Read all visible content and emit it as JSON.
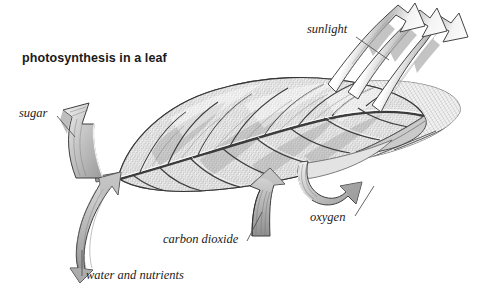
{
  "figure": {
    "title": "photosynthesis in a leaf",
    "background_color": "#ffffff",
    "ink_color": "#1b1b1b",
    "labels": [
      {
        "id": "sunlight",
        "text": "sunlight",
        "style": "italic",
        "x": 307,
        "y": 33,
        "anchor": "start"
      },
      {
        "id": "sugar",
        "text": "sugar",
        "style": "italic",
        "x": 19,
        "y": 117,
        "anchor": "start"
      },
      {
        "id": "carbon-dioxide",
        "text": "carbon dioxide",
        "style": "italic",
        "x": 163,
        "y": 243,
        "anchor": "start"
      },
      {
        "id": "oxygen",
        "text": "oxygen",
        "style": "italic",
        "x": 310,
        "y": 221,
        "anchor": "start"
      },
      {
        "id": "water-and-nutrients",
        "text": "water and nutrients",
        "style": "italic",
        "x": 86,
        "y": 279,
        "anchor": "start"
      }
    ],
    "arrows": [
      {
        "id": "sunlight-ray-1",
        "label": "sunlight",
        "direction": "into-leaf",
        "fill": "white-shaded"
      },
      {
        "id": "sunlight-ray-2",
        "label": "sunlight",
        "direction": "into-leaf",
        "fill": "white-shaded"
      },
      {
        "id": "sunlight-ray-3",
        "label": "sunlight",
        "direction": "into-leaf",
        "fill": "white-shaded"
      },
      {
        "id": "sugar-arrow",
        "label": "sugar",
        "direction": "out-of-stem",
        "fill": "gray-shaded"
      },
      {
        "id": "water-arrow",
        "label": "water and nutrients",
        "direction": "into-stem",
        "fill": "gray-shaded"
      },
      {
        "id": "co2-arrow",
        "label": "carbon dioxide",
        "direction": "into-leaf",
        "fill": "gray-shaded"
      },
      {
        "id": "oxygen-arrow",
        "label": "oxygen",
        "direction": "out-of-leaf",
        "fill": "gray-shaded"
      }
    ],
    "leaf": {
      "texture": "engraved-crosshatch",
      "parts": [
        "blade",
        "midrib",
        "lateral-veins",
        "petiole"
      ],
      "tone_light": "#e8e8e8",
      "tone_mid": "#bdbdbd",
      "tone_dark": "#8a8a8a"
    }
  }
}
